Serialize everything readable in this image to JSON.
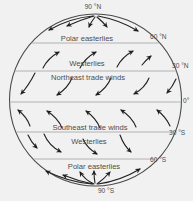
{
  "colors": {
    "background": "#f1f1f1",
    "ink": "#1f1f1f",
    "globe_outline": "#4a4a4a",
    "latitude_line": "#a3a3a3",
    "text": "#4d4d4d"
  },
  "diagram": {
    "description_label": "global wind belts on a circular globe cross-section",
    "pole_top": "90 °N",
    "pole_bottom": "90 °S",
    "latitudes": [
      {
        "id": "lat-60n",
        "label": "60 °N"
      },
      {
        "id": "lat-30n",
        "label": "30 °N"
      },
      {
        "id": "equator",
        "label": "0°"
      },
      {
        "id": "lat-30s",
        "label": "30 °S"
      },
      {
        "id": "lat-60s",
        "label": "60 °S"
      }
    ],
    "bands": [
      {
        "id": "polar-easterlies-north",
        "label": "Polar easterlies",
        "arrow_icon": "curved-wind-arrow",
        "arrow_direction": "fanning-southwest-from-north-pole"
      },
      {
        "id": "westerlies-north",
        "label": "Westerlies",
        "arrow_icon": "curved-wind-arrow",
        "arrow_direction": "northeast"
      },
      {
        "id": "northeast-trade-winds",
        "label": "Northeast trade winds",
        "arrow_icon": "curved-wind-arrow",
        "arrow_direction": "southwest"
      },
      {
        "id": "southeast-trade-winds",
        "label": "Southeast trade winds",
        "arrow_icon": "curved-wind-arrow",
        "arrow_direction": "northwest"
      },
      {
        "id": "westerlies-south",
        "label": "Westerlies",
        "arrow_icon": "curved-wind-arrow",
        "arrow_direction": "southeast"
      },
      {
        "id": "polar-easterlies-south",
        "label": "Polar easterlies",
        "arrow_icon": "curved-wind-arrow",
        "arrow_direction": "fanning-northwest-from-south-pole"
      }
    ]
  }
}
